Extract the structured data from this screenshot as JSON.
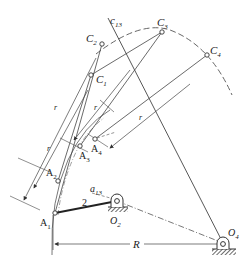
{
  "diagram": {
    "type": "four-bar linkage synthesis (crank-rocker)",
    "points": {
      "C1": {
        "label": "C",
        "sub": "1",
        "x": 91,
        "y": 75
      },
      "C2": {
        "label": "C",
        "sub": "2",
        "x": 102,
        "y": 44
      },
      "C3": {
        "label": "C",
        "sub": "3",
        "x": 162,
        "y": 32
      },
      "C4": {
        "label": "C",
        "sub": "4",
        "x": 207,
        "y": 55
      },
      "A1": {
        "label": "A",
        "sub": "1",
        "x": 55,
        "y": 213
      },
      "A2": {
        "label": "A",
        "sub": "2",
        "x": 58,
        "y": 181
      },
      "A3": {
        "label": "A",
        "sub": "3",
        "x": 80,
        "y": 146
      },
      "A4": {
        "label": "A",
        "sub": "4",
        "x": 95,
        "y": 139
      },
      "O2": {
        "label": "O",
        "sub": "2",
        "x": 117,
        "y": 201
      },
      "O4": {
        "label": "O",
        "sub": "4",
        "x": 223,
        "y": 243
      }
    },
    "labels": {
      "c13": {
        "main": "c",
        "sub": "13"
      },
      "a13": {
        "main": "a",
        "sub": "13"
      },
      "link2": "2",
      "r": "r",
      "R": "R"
    },
    "colors": {
      "line": "#333333",
      "bold": "#222222",
      "ground": "#555555"
    }
  }
}
